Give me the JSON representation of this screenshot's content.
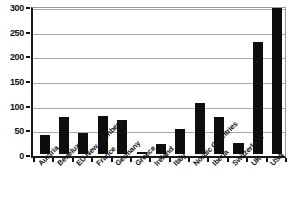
{
  "chart_data": {
    "type": "bar",
    "title": "",
    "xlabel": "",
    "ylabel": "",
    "ylim": [
      0,
      300
    ],
    "ytick_values": [
      0,
      50,
      100,
      150,
      200,
      250,
      300
    ],
    "ytick_labels": [
      "0",
      "50",
      "100",
      "150",
      "200",
      "250",
      "300"
    ],
    "grid": true,
    "legend": false,
    "bar_color": "#0d0d0d",
    "background_color": "#ffffff",
    "gridline_color": "#a8a8a8",
    "axis_color": "#111111",
    "categories": [
      "Austria",
      "Benelux",
      "EU New members",
      "France",
      "Germany",
      "Greece",
      "Ireland",
      "Italy",
      "Nordic Countries",
      "Iberia",
      "Switzerland",
      "UK",
      "USA"
    ],
    "values": [
      38,
      75,
      42,
      78,
      68,
      5,
      20,
      50,
      103,
      75,
      22,
      228,
      295
    ]
  }
}
